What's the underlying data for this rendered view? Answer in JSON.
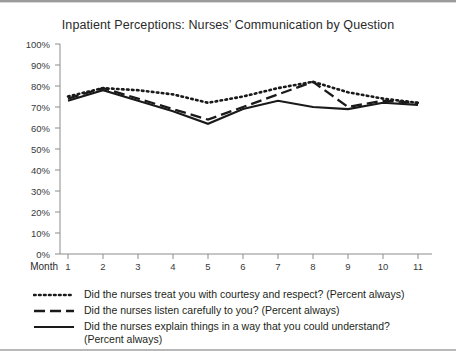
{
  "chart_title": "Inpatient Perceptions: Nurses’ Communication by Question",
  "axis": {
    "x_name": "Month",
    "y_ticks": [
      "100%",
      "90%",
      "80%",
      "70%",
      "60%",
      "50%",
      "40%",
      "30%",
      "20%",
      "10%",
      "0%"
    ],
    "x_ticks": [
      "1",
      "2",
      "3",
      "4",
      "5",
      "6",
      "7",
      "8",
      "9",
      "10",
      "11"
    ]
  },
  "legend": {
    "items": [
      {
        "style": "dotted",
        "label": "Did the nurses treat you with courtesy and respect? (Percent always)",
        "label_line2": ""
      },
      {
        "style": "dashed",
        "label": "Did the nurses listen carefully to you? (Percent always)",
        "label_line2": ""
      },
      {
        "style": "solid",
        "label": "Did the nurses explain things in a way that you could understand?",
        "label_line2": "(Percent always)"
      }
    ]
  },
  "colors": {
    "line": "#1a1a1a",
    "axis": "#8c8c8c",
    "text": "#231f20",
    "background": "#ffffff"
  },
  "chart_data": {
    "type": "line",
    "title": "Inpatient Perceptions: Nurses’ Communication by Question",
    "xlabel": "Month",
    "ylabel": "",
    "xlim": [
      1,
      11
    ],
    "ylim": [
      0,
      100
    ],
    "grid": false,
    "legend_position": "below",
    "categories": [
      "1",
      "2",
      "3",
      "4",
      "5",
      "6",
      "7",
      "8",
      "9",
      "10",
      "11"
    ],
    "x": [
      1,
      2,
      3,
      4,
      5,
      6,
      7,
      8,
      9,
      10,
      11
    ],
    "series": [
      {
        "name": "Did the nurses treat you with courtesy and respect? (Percent always)",
        "style": "dotted",
        "values": [
          75,
          79,
          78,
          76,
          72,
          75,
          79,
          82,
          77,
          74,
          72
        ]
      },
      {
        "name": "Did the nurses listen carefully to you? (Percent always)",
        "style": "dashed",
        "values": [
          74,
          79,
          74,
          69,
          64,
          70,
          76,
          82,
          70,
          73,
          72
        ]
      },
      {
        "name": "Did the nurses explain things in a way that you could understand? (Percent always)",
        "style": "solid",
        "values": [
          73,
          78,
          73,
          68,
          62,
          69,
          73,
          70,
          69,
          72,
          71
        ]
      }
    ]
  }
}
